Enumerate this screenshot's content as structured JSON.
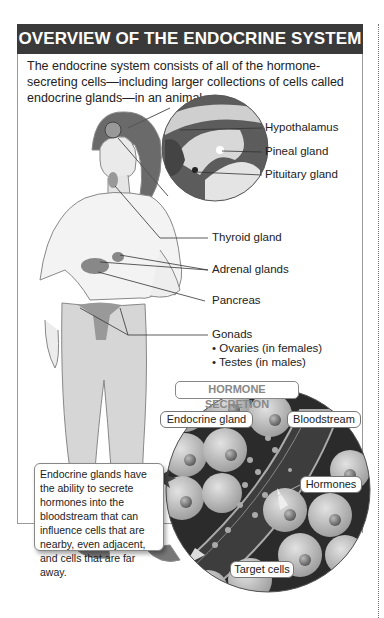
{
  "header": {
    "title": "OVERVIEW OF THE ENDOCRINE SYSTEM"
  },
  "intro": {
    "text": "The endocrine system consists of all of the hormone-secreting cells—including larger collections of cells called endocrine glands—in an animal."
  },
  "labels": {
    "hypothalamus": "Hypothalamus",
    "pineal": "Pineal gland",
    "pituitary": "Pituitary gland",
    "thyroid": "Thyroid gland",
    "adrenal": "Adrenal glands",
    "pancreas": "Pancreas",
    "gonads": "Gonads",
    "ovaries": "• Ovaries (in females)",
    "testes": "• Testes (in males)"
  },
  "secretion": {
    "title": "HORMONE SECRETION",
    "endocrine_gland": "Endocrine gland",
    "bloodstream": "Bloodstream",
    "hormones": "Hormones",
    "target_cells": "Target cells",
    "callout": "Endocrine glands have the ability to secrete hormones into the bloodstream that can influence cells that are nearby, even adjacent, and cells that are far away."
  },
  "colors": {
    "header_bg": "#3a3a3a",
    "frame": "#9a9a9a",
    "circle_dark": "#2b2b2b",
    "cell": "#c8c8c8"
  }
}
